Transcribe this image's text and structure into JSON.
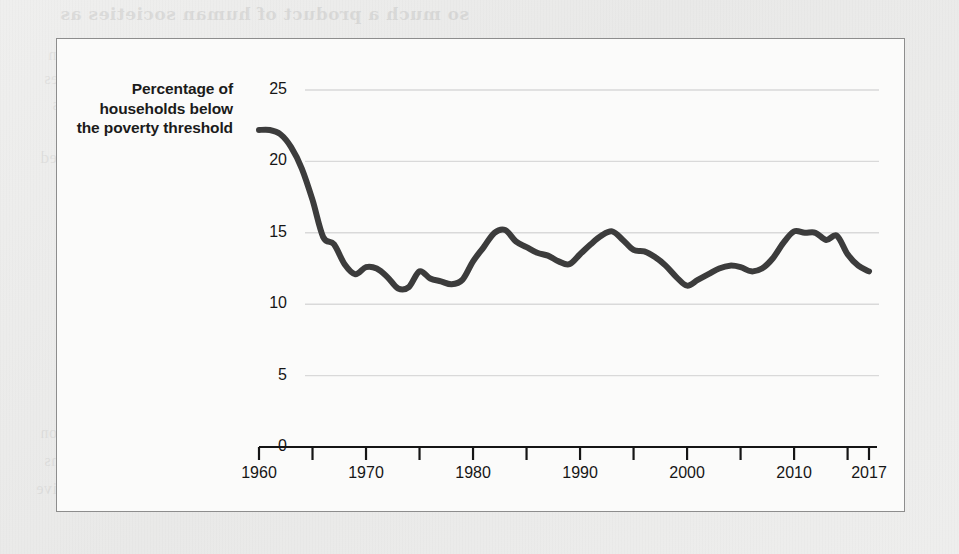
{
  "figure": {
    "frame_color": "#8d8d8d",
    "background_color": "#fbfbfa",
    "page_color": "#ececeb"
  },
  "ghost_text": {
    "l1": "so much a product of human societies as",
    "l2": "desire for reform itself. And the rulers who have been",
    "l3": "are not responsible for the progress of human societies",
    "l4": "a common example of this",
    "l5": "than simple fairness durable. Members of this group wanted",
    "l6": "every single family or poor households",
    "l7": "Why Do Liberals Anti-Poverty",
    "l8": "Programs?",
    "l9": "the point of view of a social scientist, the question of",
    "l10": "whether the programs work as intended is secondary to a question",
    "l11": "that helps us understand the reason we start with precise conditions",
    "l12": "we understand the scope of the problem we are measuring a lower relative"
  },
  "chart_data": {
    "type": "line",
    "title": "",
    "ylabel": "Percentage of households below the poverty threshold",
    "xlabel": "",
    "ylim": [
      0,
      25
    ],
    "xlim": [
      1960,
      2017
    ],
    "yticks": [
      0,
      5,
      10,
      15,
      20,
      25
    ],
    "ytick_labels": [
      "0",
      "5",
      "10",
      "15",
      "20",
      "25"
    ],
    "xticks": [
      1960,
      1970,
      1980,
      1990,
      2000,
      2010,
      2017
    ],
    "xtick_labels": [
      "1960",
      "1970",
      "1980",
      "1990",
      "2000",
      "2010",
      "2017"
    ],
    "xminor_ticks": [
      1965,
      1975,
      1985,
      1995,
      2005,
      2015
    ],
    "grid": "horizontal",
    "grid_color": "#d9d9d9",
    "line_color": "#3c3c3c",
    "line_width": 6,
    "legend": null,
    "x": [
      1960,
      1961,
      1962,
      1963,
      1964,
      1965,
      1966,
      1967,
      1968,
      1969,
      1970,
      1971,
      1972,
      1973,
      1974,
      1975,
      1976,
      1977,
      1978,
      1979,
      1980,
      1981,
      1982,
      1983,
      1984,
      1985,
      1986,
      1987,
      1988,
      1989,
      1990,
      1991,
      1992,
      1993,
      1994,
      1995,
      1996,
      1997,
      1998,
      1999,
      2000,
      2001,
      2002,
      2003,
      2004,
      2005,
      2006,
      2007,
      2008,
      2009,
      2010,
      2011,
      2012,
      2013,
      2014,
      2015,
      2016,
      2017
    ],
    "values": [
      22.2,
      22.2,
      21.9,
      21.0,
      19.5,
      17.3,
      14.7,
      14.2,
      12.8,
      12.1,
      12.6,
      12.5,
      11.9,
      11.1,
      11.2,
      12.3,
      11.8,
      11.6,
      11.4,
      11.7,
      13.0,
      14.0,
      15.0,
      15.2,
      14.4,
      14.0,
      13.6,
      13.4,
      13.0,
      12.8,
      13.5,
      14.2,
      14.8,
      15.1,
      14.5,
      13.8,
      13.7,
      13.3,
      12.7,
      11.9,
      11.3,
      11.7,
      12.1,
      12.5,
      12.7,
      12.6,
      12.3,
      12.5,
      13.2,
      14.3,
      15.1,
      15.0,
      15.0,
      14.5,
      14.8,
      13.5,
      12.7,
      12.3
    ],
    "series_name": "Percentage of households below the poverty threshold"
  }
}
